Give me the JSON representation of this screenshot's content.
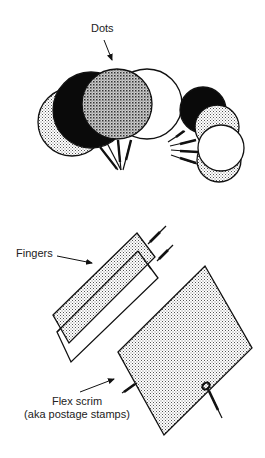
{
  "labels": {
    "dots": "Dots",
    "fingers": "Fingers",
    "flex_scrim_line1": "Flex scrim",
    "flex_scrim_line2": "(aka postage stamps)"
  },
  "colors": {
    "ink": "#111111",
    "background": "#ffffff",
    "black_fill": "#0a0a0a",
    "light_stipple": "#d6d6d6",
    "medium_hatch": "#b0b0b0"
  },
  "elements": {
    "top_group_circles": [
      "light-stipple",
      "black",
      "crosshatch",
      "white"
    ],
    "right_group_circles": [
      "black",
      "light-stipple",
      "white",
      "light-stipple"
    ],
    "fingers": [
      "stippled-finger",
      "white-finger"
    ],
    "scrim": "stippled-rectangle"
  }
}
